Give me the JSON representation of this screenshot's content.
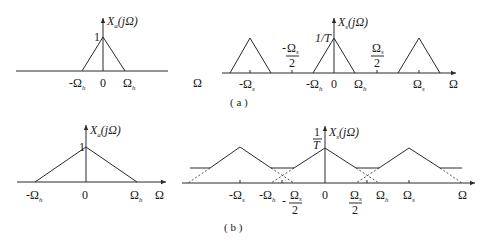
{
  "figure": {
    "captions": {
      "a": "( a )",
      "b": "( b )"
    },
    "panel_a_left": {
      "ylabel": "X",
      "ylabel_sub": "a",
      "ylabel_arg": "(jΩ)",
      "peak_label": "1",
      "ticks": {
        "neg": "-Ω",
        "neg_sub": "h",
        "zero": "0",
        "pos": "Ω",
        "pos_sub": "h"
      },
      "xlabel": "Ω"
    },
    "panel_a_right": {
      "ylabel": "X",
      "ylabel_sub": "s",
      "ylabel_arg": "(jΩ)",
      "peak_label": "1/T",
      "ticks": {
        "neg_s": "-Ω",
        "neg_s_sub": "s",
        "neg_half_num": "Ω",
        "neg_half_sub": "s",
        "neg_half_den": "2",
        "neg_half_sign": "-",
        "neg_h": "-Ω",
        "neg_h_sub": "h",
        "zero": "0",
        "pos_h": "Ω",
        "pos_h_sub": "h",
        "pos_half_num": "Ω",
        "pos_half_sub": "s",
        "pos_half_den": "2",
        "pos_s": "Ω",
        "pos_s_sub": "s"
      },
      "xlabel": "Ω"
    },
    "panel_b_left": {
      "ylabel": "X",
      "ylabel_sub": "a",
      "ylabel_arg": "(jΩ)",
      "peak_label": "1",
      "ticks": {
        "neg": "-Ω",
        "neg_sub": "h",
        "zero": "0",
        "pos": "Ω",
        "pos_sub": "h"
      },
      "xlabel": "Ω"
    },
    "panel_b_right": {
      "ylabel": "X",
      "ylabel_sub": "s",
      "ylabel_arg": "(jΩ)",
      "peak_num": "1",
      "peak_den": "T",
      "ticks": {
        "neg_s": "-Ω",
        "neg_s_sub": "s",
        "neg_h": "-Ω",
        "neg_h_sub": "h",
        "neg_half_num": "Ω",
        "neg_half_sub": "s",
        "neg_half_den": "2",
        "neg_half_sign": "-",
        "zero": "0",
        "pos_half_num": "Ω",
        "pos_half_sub": "s",
        "pos_half_den": "2",
        "pos_h": "Ω",
        "pos_h_sub": "h",
        "pos_s": "Ω",
        "pos_s_sub": "s"
      },
      "xlabel": "Ω"
    }
  }
}
